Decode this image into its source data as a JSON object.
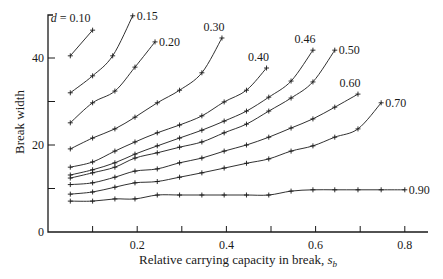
{
  "chart_data": {
    "type": "line",
    "title": "",
    "xlabel": "Relative carrying capacity in break, s_b",
    "xlabel_main": "Relative carrying capacity in break, ",
    "xlabel_var": "s",
    "xlabel_sub": "b",
    "ylabel": "Break width",
    "xlim": [
      0,
      0.85
    ],
    "ylim": [
      0,
      50
    ],
    "x_ticks": [
      0.1,
      0.2,
      0.3,
      0.4,
      0.5,
      0.6,
      0.7,
      0.8
    ],
    "x_tick_labels": [
      {
        "value": 0.2,
        "label": "0.2"
      },
      {
        "value": 0.4,
        "label": "0.4"
      },
      {
        "value": 0.6,
        "label": "0.6"
      },
      {
        "value": 0.8,
        "label": "0.8"
      }
    ],
    "y_ticks": [
      10,
      20,
      30,
      40
    ],
    "y_tick_labels": [
      {
        "value": 0,
        "label": "0"
      },
      {
        "value": 20,
        "label": "20"
      },
      {
        "value": 40,
        "label": "40"
      }
    ],
    "origin_label": "0",
    "grid": false,
    "legend": "inline labels at curve ends",
    "parameter": "d",
    "series": [
      {
        "name": "d = 0.10",
        "label": "d = 0.10",
        "label_pos": "left-above",
        "x": [
          0.05,
          0.1
        ],
        "y": [
          40.5,
          46.4
        ]
      },
      {
        "name": "0.15",
        "label": "0.15",
        "label_pos": "right",
        "x": [
          0.05,
          0.1,
          0.145,
          0.19
        ],
        "y": [
          32.0,
          35.9,
          40.5,
          49.7
        ]
      },
      {
        "name": "0.20",
        "label": "0.20",
        "label_pos": "right",
        "x": [
          0.05,
          0.1,
          0.15,
          0.195,
          0.24
        ],
        "y": [
          25.1,
          29.7,
          32.4,
          37.9,
          43.7
        ]
      },
      {
        "name": "0.30",
        "label": "0.30",
        "label_pos": "above",
        "x": [
          0.05,
          0.1,
          0.15,
          0.195,
          0.245,
          0.295,
          0.345,
          0.39
        ],
        "y": [
          19.1,
          21.6,
          23.7,
          26.4,
          29.7,
          32.6,
          36.6,
          44.6
        ]
      },
      {
        "name": "0.40",
        "label": "0.40",
        "label_pos": "above",
        "x": [
          0.05,
          0.1,
          0.15,
          0.195,
          0.245,
          0.295,
          0.345,
          0.395,
          0.445,
          0.49
        ],
        "y": [
          14.9,
          16.1,
          18.6,
          20.7,
          22.8,
          24.6,
          26.7,
          29.9,
          32.6,
          37.7
        ]
      },
      {
        "name": "0.46",
        "label": "0.46",
        "label_pos": "above",
        "x": [
          0.05,
          0.1,
          0.15,
          0.195,
          0.245,
          0.295,
          0.345,
          0.395,
          0.445,
          0.495,
          0.545,
          0.594
        ],
        "y": [
          13.1,
          14.3,
          15.9,
          17.9,
          19.8,
          21.6,
          23.4,
          25.5,
          27.8,
          31.0,
          34.7,
          41.8
        ]
      },
      {
        "name": "0.50",
        "label": "0.50",
        "label_pos": "right",
        "x": [
          0.05,
          0.1,
          0.15,
          0.195,
          0.245,
          0.295,
          0.345,
          0.395,
          0.445,
          0.495,
          0.545,
          0.594,
          0.643
        ],
        "y": [
          12.4,
          13.6,
          14.9,
          17.0,
          18.2,
          19.5,
          20.7,
          22.8,
          24.8,
          27.8,
          30.8,
          34.5,
          41.8
        ]
      },
      {
        "name": "0.60",
        "label": "0.60",
        "label_pos": "above",
        "x": [
          0.05,
          0.1,
          0.15,
          0.195,
          0.245,
          0.295,
          0.345,
          0.395,
          0.445,
          0.495,
          0.545,
          0.594,
          0.643,
          0.695
        ],
        "y": [
          10.9,
          11.3,
          12.6,
          14.0,
          14.5,
          15.9,
          17.0,
          18.6,
          20.0,
          21.8,
          23.9,
          26.0,
          28.7,
          31.7
        ]
      },
      {
        "name": "0.70",
        "label": "0.70",
        "label_pos": "right",
        "x": [
          0.05,
          0.1,
          0.15,
          0.195,
          0.245,
          0.295,
          0.345,
          0.395,
          0.445,
          0.495,
          0.545,
          0.594,
          0.643,
          0.695,
          0.747
        ],
        "y": [
          8.7,
          9.2,
          10.3,
          11.3,
          11.6,
          12.6,
          13.6,
          14.7,
          15.8,
          16.8,
          18.6,
          19.8,
          21.8,
          23.7,
          29.7
        ]
      },
      {
        "name": "0.90",
        "label": "0.90",
        "label_pos": "right",
        "x": [
          0.05,
          0.1,
          0.15,
          0.195,
          0.245,
          0.295,
          0.345,
          0.395,
          0.445,
          0.495,
          0.545,
          0.594,
          0.643,
          0.695,
          0.747,
          0.8
        ],
        "y": [
          7.1,
          7.1,
          7.6,
          7.6,
          8.5,
          8.5,
          8.5,
          8.5,
          8.5,
          8.5,
          9.4,
          9.7,
          9.7,
          9.7,
          9.7,
          9.7
        ]
      }
    ]
  },
  "layout": {
    "x0_px": 48,
    "px_per_x": 446,
    "y0_px": 232,
    "px_per_y": 4.35,
    "axis_top_px": 15,
    "axis_right_px": 428
  }
}
